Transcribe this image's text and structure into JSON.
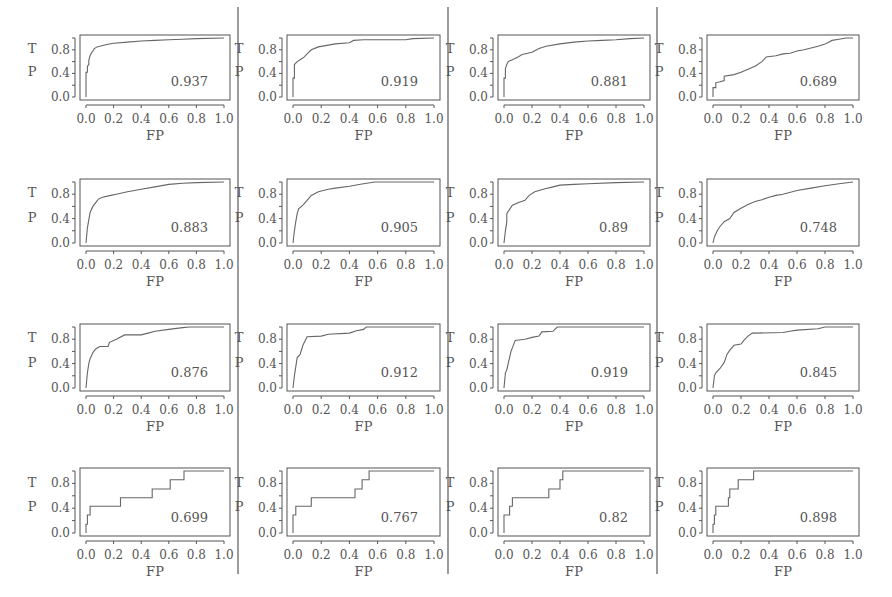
{
  "chart_data": {
    "type": "line",
    "layout": {
      "rows": 4,
      "cols": 4,
      "grid": false,
      "legend": "none"
    },
    "xlabel": "FP",
    "ylabel": "TP",
    "xticks": [
      "0.0",
      "0.2",
      "0.4",
      "0.6",
      "0.8",
      "1.0"
    ],
    "yticks": [
      "0.0",
      "0.4",
      "0.8"
    ],
    "xlim": [
      0,
      1
    ],
    "ylim": [
      0,
      1
    ],
    "panels": [
      {
        "row": 0,
        "col": 0,
        "auc": "0.937",
        "x": [
          0,
          0,
          0.01,
          0.01,
          0.02,
          0.02,
          0.03,
          0.04,
          0.05,
          0.06,
          0.08,
          0.1,
          0.15,
          0.2,
          0.3,
          0.4,
          0.5,
          0.6,
          0.7,
          0.8,
          1.0
        ],
        "y": [
          0,
          0.42,
          0.42,
          0.52,
          0.55,
          0.62,
          0.7,
          0.75,
          0.78,
          0.82,
          0.85,
          0.86,
          0.89,
          0.91,
          0.93,
          0.95,
          0.96,
          0.97,
          0.98,
          0.99,
          1.0
        ]
      },
      {
        "row": 0,
        "col": 1,
        "auc": "0.919",
        "x": [
          0,
          0,
          0.01,
          0.01,
          0.03,
          0.05,
          0.08,
          0.1,
          0.13,
          0.18,
          0.25,
          0.3,
          0.4,
          0.43,
          0.5,
          0.6,
          0.8,
          0.85,
          1.0
        ],
        "y": [
          0,
          0.32,
          0.32,
          0.55,
          0.6,
          0.63,
          0.68,
          0.73,
          0.8,
          0.85,
          0.88,
          0.9,
          0.92,
          0.96,
          0.97,
          0.97,
          0.97,
          0.99,
          1.0
        ]
      },
      {
        "row": 0,
        "col": 2,
        "auc": "0.881",
        "x": [
          0,
          0,
          0.01,
          0.01,
          0.02,
          0.03,
          0.06,
          0.1,
          0.13,
          0.2,
          0.25,
          0.3,
          0.4,
          0.5,
          0.6,
          0.7,
          0.8,
          0.9,
          1.0
        ],
        "y": [
          0,
          0.32,
          0.32,
          0.48,
          0.55,
          0.6,
          0.63,
          0.68,
          0.72,
          0.76,
          0.82,
          0.86,
          0.9,
          0.93,
          0.95,
          0.96,
          0.97,
          0.99,
          1.0
        ]
      },
      {
        "row": 0,
        "col": 3,
        "auc": "0.689",
        "x": [
          0,
          0,
          0.02,
          0.02,
          0.05,
          0.08,
          0.08,
          0.15,
          0.2,
          0.25,
          0.3,
          0.35,
          0.38,
          0.45,
          0.5,
          0.55,
          0.6,
          0.65,
          0.7,
          0.75,
          0.8,
          0.82,
          0.85,
          0.9,
          0.95,
          1.0
        ],
        "y": [
          0,
          0.16,
          0.16,
          0.24,
          0.26,
          0.28,
          0.35,
          0.38,
          0.42,
          0.47,
          0.52,
          0.6,
          0.68,
          0.7,
          0.73,
          0.74,
          0.78,
          0.8,
          0.83,
          0.86,
          0.9,
          0.92,
          0.96,
          0.98,
          1.0,
          1.0
        ]
      },
      {
        "row": 1,
        "col": 0,
        "auc": "0.883",
        "x": [
          0,
          0.01,
          0.02,
          0.03,
          0.05,
          0.07,
          0.09,
          0.12,
          0.18,
          0.22,
          0.3,
          0.4,
          0.5,
          0.6,
          0.7,
          0.8,
          1.0
        ],
        "y": [
          0,
          0.25,
          0.38,
          0.5,
          0.6,
          0.66,
          0.72,
          0.75,
          0.78,
          0.8,
          0.84,
          0.88,
          0.92,
          0.96,
          0.98,
          0.99,
          1.0
        ]
      },
      {
        "row": 1,
        "col": 1,
        "auc": "0.905",
        "x": [
          0,
          0.01,
          0.02,
          0.03,
          0.04,
          0.07,
          0.1,
          0.13,
          0.18,
          0.25,
          0.3,
          0.4,
          0.5,
          0.58,
          0.7,
          1.0
        ],
        "y": [
          0,
          0.2,
          0.35,
          0.48,
          0.56,
          0.62,
          0.7,
          0.78,
          0.84,
          0.88,
          0.9,
          0.93,
          0.97,
          1.0,
          1.0,
          1.0
        ]
      },
      {
        "row": 1,
        "col": 2,
        "auc": "0.89",
        "x": [
          0,
          0.01,
          0.02,
          0.02,
          0.04,
          0.06,
          0.1,
          0.15,
          0.18,
          0.22,
          0.28,
          0.35,
          0.4,
          0.5,
          0.6,
          0.8,
          1.0
        ],
        "y": [
          0,
          0.2,
          0.35,
          0.48,
          0.55,
          0.62,
          0.66,
          0.7,
          0.78,
          0.84,
          0.88,
          0.92,
          0.95,
          0.96,
          0.97,
          0.99,
          1.0
        ]
      },
      {
        "row": 1,
        "col": 3,
        "auc": "0.748",
        "x": [
          0,
          0.01,
          0.03,
          0.05,
          0.08,
          0.12,
          0.15,
          0.2,
          0.25,
          0.3,
          0.35,
          0.4,
          0.45,
          0.5,
          0.6,
          0.7,
          0.8,
          0.9,
          1.0
        ],
        "y": [
          0,
          0.1,
          0.2,
          0.27,
          0.35,
          0.4,
          0.5,
          0.57,
          0.63,
          0.68,
          0.71,
          0.75,
          0.78,
          0.8,
          0.86,
          0.9,
          0.94,
          0.97,
          1.0
        ]
      },
      {
        "row": 2,
        "col": 0,
        "auc": "0.876",
        "x": [
          0,
          0.01,
          0.02,
          0.03,
          0.05,
          0.07,
          0.1,
          0.16,
          0.17,
          0.22,
          0.28,
          0.4,
          0.45,
          0.5,
          0.6,
          0.7,
          0.75,
          1.0
        ],
        "y": [
          0,
          0.25,
          0.4,
          0.48,
          0.58,
          0.64,
          0.68,
          0.68,
          0.75,
          0.8,
          0.87,
          0.87,
          0.9,
          0.93,
          0.96,
          0.99,
          1.0,
          1.0
        ]
      },
      {
        "row": 2,
        "col": 1,
        "auc": "0.912",
        "x": [
          0,
          0.01,
          0.02,
          0.03,
          0.05,
          0.07,
          0.1,
          0.2,
          0.25,
          0.4,
          0.45,
          0.5,
          0.52,
          0.6,
          1.0
        ],
        "y": [
          0,
          0.2,
          0.35,
          0.5,
          0.55,
          0.7,
          0.84,
          0.85,
          0.88,
          0.9,
          0.94,
          0.96,
          1.0,
          1.0,
          1.0
        ]
      },
      {
        "row": 2,
        "col": 2,
        "auc": "0.919",
        "x": [
          0,
          0.01,
          0.02,
          0.03,
          0.05,
          0.07,
          0.08,
          0.15,
          0.2,
          0.25,
          0.27,
          0.35,
          0.38,
          0.5,
          1.0
        ],
        "y": [
          0,
          0.25,
          0.3,
          0.4,
          0.6,
          0.72,
          0.78,
          0.8,
          0.83,
          0.85,
          0.92,
          0.93,
          1.0,
          1.0,
          1.0
        ]
      },
      {
        "row": 2,
        "col": 3,
        "auc": "0.845",
        "x": [
          0,
          0.01,
          0.02,
          0.05,
          0.08,
          0.1,
          0.12,
          0.15,
          0.2,
          0.22,
          0.25,
          0.28,
          0.3,
          0.5,
          0.55,
          0.6,
          0.75,
          0.8,
          1.0
        ],
        "y": [
          0,
          0.2,
          0.25,
          0.32,
          0.42,
          0.55,
          0.62,
          0.7,
          0.72,
          0.78,
          0.85,
          0.9,
          0.9,
          0.91,
          0.93,
          0.95,
          0.97,
          1.0,
          1.0
        ]
      },
      {
        "row": 3,
        "col": 0,
        "auc": "0.699",
        "x": [
          0,
          0,
          0.01,
          0.01,
          0.03,
          0.03,
          0.25,
          0.25,
          0.48,
          0.48,
          0.61,
          0.61,
          0.71,
          0.71,
          1.0
        ],
        "y": [
          0,
          0.14,
          0.14,
          0.29,
          0.29,
          0.43,
          0.43,
          0.57,
          0.57,
          0.71,
          0.71,
          0.86,
          0.86,
          1.0,
          1.0
        ]
      },
      {
        "row": 3,
        "col": 1,
        "auc": "0.767",
        "x": [
          0,
          0,
          0.02,
          0.02,
          0.13,
          0.13,
          0.44,
          0.44,
          0.49,
          0.49,
          0.54,
          0.54,
          1.0
        ],
        "y": [
          0,
          0.29,
          0.29,
          0.43,
          0.43,
          0.57,
          0.57,
          0.71,
          0.71,
          0.86,
          0.86,
          1.0,
          1.0
        ]
      },
      {
        "row": 3,
        "col": 2,
        "auc": "0.82",
        "x": [
          0,
          0,
          0.04,
          0.04,
          0.06,
          0.06,
          0.32,
          0.32,
          0.4,
          0.4,
          0.42,
          0.42,
          1.0
        ],
        "y": [
          0,
          0.29,
          0.29,
          0.43,
          0.43,
          0.57,
          0.57,
          0.71,
          0.71,
          0.86,
          0.86,
          1.0,
          1.0
        ]
      },
      {
        "row": 3,
        "col": 3,
        "auc": "0.898",
        "x": [
          0,
          0,
          0.01,
          0.01,
          0.02,
          0.02,
          0.11,
          0.11,
          0.12,
          0.12,
          0.18,
          0.18,
          0.29,
          0.29,
          1.0
        ],
        "y": [
          0,
          0.14,
          0.14,
          0.29,
          0.29,
          0.43,
          0.43,
          0.57,
          0.57,
          0.71,
          0.71,
          0.86,
          0.86,
          1.0,
          1.0
        ]
      }
    ]
  },
  "figure": {
    "line_color": "#666666",
    "axis_color": "#555555",
    "divider_color": "#666666"
  }
}
